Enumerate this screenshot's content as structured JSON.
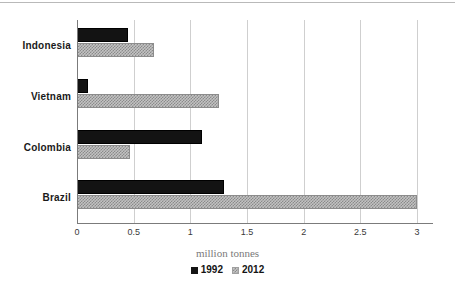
{
  "chart_data": {
    "type": "bar",
    "orientation": "horizontal",
    "title": "",
    "subtitle": "",
    "xlabel": "million tonnes",
    "ylabel": "",
    "categories": [
      "Indonesia",
      "Vietnam",
      "Colombia",
      "Brazil"
    ],
    "series": [
      {
        "name": "1992",
        "values": [
          0.45,
          0.1,
          1.1,
          1.3
        ],
        "color": "#131313"
      },
      {
        "name": "2012",
        "values": [
          0.68,
          1.25,
          0.47,
          3.0
        ],
        "color": "#c2c2c2"
      }
    ],
    "xlim": [
      0,
      3
    ],
    "xticks": [
      0,
      0.5,
      1,
      1.5,
      2,
      2.5,
      3
    ],
    "xticklabels": [
      "0",
      "0.5",
      "1",
      "1.5",
      "2",
      "2.5",
      "3"
    ],
    "grid": "vertical",
    "legend_position": "bottom",
    "legend_entries": [
      "1992",
      "2012"
    ]
  },
  "axis_title": "million tonnes",
  "legend": {
    "items": [
      {
        "label": "1992",
        "swatch": "solid-black-square-icon"
      },
      {
        "label": "2012",
        "swatch": "checkered-gray-square-icon"
      }
    ]
  }
}
